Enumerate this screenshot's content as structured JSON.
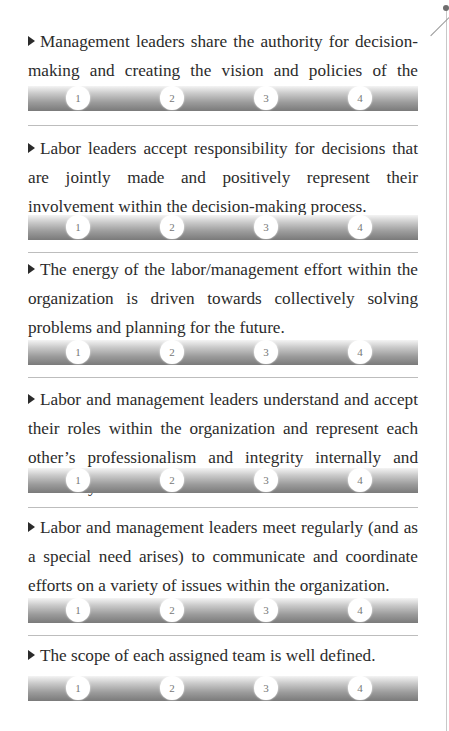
{
  "decor": {
    "page_edge_color": "#c8c8c8"
  },
  "rating_scale": [
    "1",
    "2",
    "3",
    "4"
  ],
  "items": [
    {
      "text": "Management leaders share the authority for decision-mak­ing and creating the vision and policies of the organization.",
      "ratings": [
        "1",
        "2",
        "3",
        "4"
      ]
    },
    {
      "text": "Labor leaders accept responsibility for decisions that are jointly made and positively represent their involvement within the decision-making process.",
      "ratings": [
        "1",
        "2",
        "3",
        "4"
      ]
    },
    {
      "text": "The energy of the labor/management effort within the or­ganization is driven towards collectively solving problems and planning for the future.",
      "ratings": [
        "1",
        "2",
        "3",
        "4"
      ]
    },
    {
      "text": "Labor and management leaders understand and accept their roles within the organization and represent each other’s pro­fessionalism and integrity internally and externally.",
      "ratings": [
        "1",
        "2",
        "3",
        "4"
      ]
    },
    {
      "text": "Labor and management leaders meet regularly (and as a special need arises) to communicate and coordinate efforts on a variety of issues within the organization.",
      "ratings": [
        "1",
        "2",
        "3",
        "4"
      ]
    },
    {
      "text": "The scope of each assigned team is well defined.",
      "ratings": [
        "1",
        "2",
        "3",
        "4"
      ]
    }
  ]
}
